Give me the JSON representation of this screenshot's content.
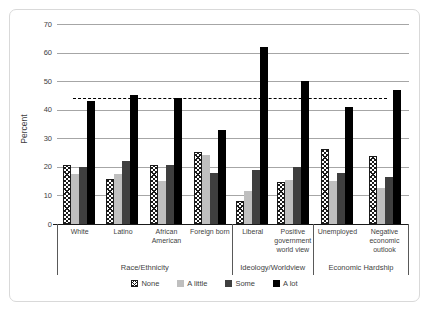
{
  "chart_data": {
    "type": "bar",
    "title": "",
    "ylabel": "Percent",
    "xlabel": "",
    "ylim": [
      0,
      70
    ],
    "ytick_step": 10,
    "grid": true,
    "legend_position": "bottom",
    "legend": [
      "None",
      "A little",
      "Some",
      "A lot"
    ],
    "reference_line_y": 44,
    "sections": [
      {
        "label": "Race/Ethnicity",
        "categories": [
          "White",
          "Latino",
          "African American",
          "Foreign born"
        ],
        "series": [
          {
            "name": "None",
            "values": [
              20,
              15,
              20,
              24.5
            ]
          },
          {
            "name": "A little",
            "values": [
              17.5,
              17.5,
              15,
              24
            ]
          },
          {
            "name": "Some",
            "values": [
              20,
              22,
              20.5,
              18
            ]
          },
          {
            "name": "A lot",
            "values": [
              43,
              45,
              44,
              33
            ]
          }
        ]
      },
      {
        "label": "Ideology/Worldview",
        "categories": [
          "Liberal",
          "Positive government world view"
        ],
        "series": [
          {
            "name": "None",
            "values": [
              7.5,
              14
            ]
          },
          {
            "name": "A little",
            "values": [
              11.5,
              15.5
            ]
          },
          {
            "name": "Some",
            "values": [
              19,
              20
            ]
          },
          {
            "name": "A lot",
            "values": [
              62,
              50
            ]
          }
        ]
      },
      {
        "label": "Economic Hardship",
        "categories": [
          "Unemployed",
          "Negative economic outlook"
        ],
        "series": [
          {
            "name": "None",
            "values": [
              25.5,
              23
            ]
          },
          {
            "name": "A little",
            "values": [
              15,
              12.5
            ]
          },
          {
            "name": "Some",
            "values": [
              18,
              16.5
            ]
          },
          {
            "name": "A lot",
            "values": [
              41,
              47
            ]
          }
        ]
      }
    ],
    "colors": {
      "grid": "#a6a6a6",
      "axis": "#1a1a1a",
      "text": "#3f3f3f",
      "frame_border": "#d9d9d9",
      "reference_line": "#000000",
      "bars": {
        "None": "hatch",
        "A little": "#bfbfbf",
        "Some": "#3f3f3f",
        "A lot": "#000000"
      }
    }
  }
}
